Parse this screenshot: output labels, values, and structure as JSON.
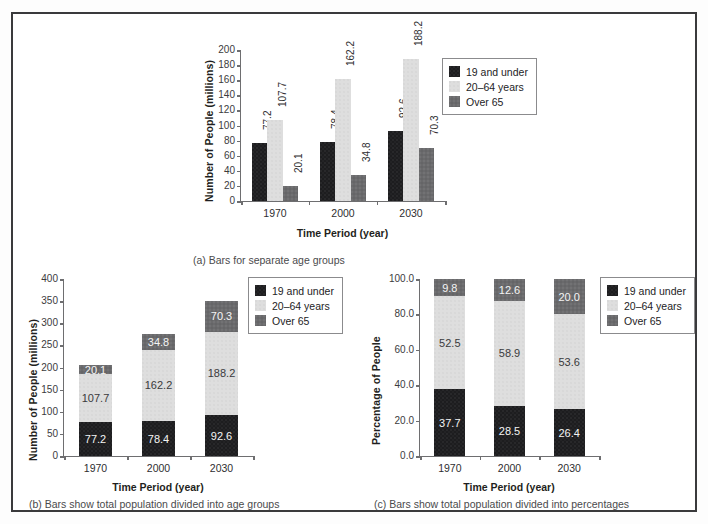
{
  "figure": {
    "legend_items": [
      {
        "label": "19 and under",
        "color": "#1d1d1f",
        "key": "under19"
      },
      {
        "label": "20–64 years",
        "color": "#dedede",
        "key": "age20_64"
      },
      {
        "label": "Over 65",
        "color": "#6a6a6c",
        "key": "over65"
      }
    ],
    "captions": {
      "a": "(a) Bars for separate age groups",
      "b": "(b) Bars show total population divided into age groups",
      "c": "(c) Bars show total population divided into percentages"
    }
  },
  "chart_data": [
    {
      "id": "a",
      "type": "bar",
      "title": "",
      "caption": "(a) Bars for separate age groups",
      "xlabel": "Time Period (year)",
      "ylabel": "Number of People (millions)",
      "categories": [
        "1970",
        "2000",
        "2030"
      ],
      "ylim": [
        0,
        200
      ],
      "yticks": [
        "0",
        "20",
        "40",
        "60",
        "80",
        "100",
        "120",
        "140",
        "160",
        "180",
        "200"
      ],
      "ytick_values": [
        0,
        20,
        40,
        60,
        80,
        100,
        120,
        140,
        160,
        180,
        200
      ],
      "grid": false,
      "legend_position": "upper-right-outside",
      "grouping": "grouped",
      "series": [
        {
          "name": "19 and under",
          "color": "#1d1d1f",
          "values": [
            77.2,
            78.4,
            92.6
          ],
          "labels": [
            "77.2",
            "78.4",
            "92.6"
          ]
        },
        {
          "name": "20–64 years",
          "color": "#dedede",
          "values": [
            107.7,
            162.2,
            188.2
          ],
          "labels": [
            "107.7",
            "162.2",
            "188.2"
          ]
        },
        {
          "name": "Over 65",
          "color": "#6a6a6c",
          "values": [
            20.1,
            34.8,
            70.3
          ],
          "labels": [
            "20.1",
            "34.8",
            "70.3"
          ]
        }
      ]
    },
    {
      "id": "b",
      "type": "bar",
      "title": "",
      "caption": "(b) Bars show total population divided into age groups",
      "xlabel": "Time Period (year)",
      "ylabel": "Number of People (millions)",
      "categories": [
        "1970",
        "2000",
        "2030"
      ],
      "ylim": [
        0,
        400
      ],
      "yticks": [
        "0",
        "50",
        "100",
        "150",
        "200",
        "250",
        "300",
        "350",
        "400"
      ],
      "ytick_values": [
        0,
        50,
        100,
        150,
        200,
        250,
        300,
        350,
        400
      ],
      "grid": false,
      "legend_position": "upper-right-inside",
      "grouping": "stacked",
      "series": [
        {
          "name": "19 and under",
          "color": "#1d1d1f",
          "values": [
            77.2,
            78.4,
            92.6
          ],
          "labels": [
            "77.2",
            "78.4",
            "92.6"
          ]
        },
        {
          "name": "20–64 years",
          "color": "#dedede",
          "values": [
            107.7,
            162.2,
            188.2
          ],
          "labels": [
            "107.7",
            "162.2",
            "188.2"
          ]
        },
        {
          "name": "Over 65",
          "color": "#6a6a6c",
          "values": [
            20.1,
            34.8,
            70.3
          ],
          "labels": [
            "20.1",
            "34.8",
            "70.3"
          ]
        }
      ],
      "totals": [
        205.0,
        275.4,
        351.1
      ]
    },
    {
      "id": "c",
      "type": "bar",
      "title": "",
      "caption": "(c) Bars show total population divided into percentages",
      "xlabel": "Time Period (year)",
      "ylabel": "Percentage of People",
      "categories": [
        "1970",
        "2000",
        "2030"
      ],
      "ylim": [
        0,
        100
      ],
      "yticks": [
        "0.0",
        "20.0",
        "40.0",
        "60.0",
        "80.0",
        "100.0"
      ],
      "ytick_values": [
        0,
        20,
        40,
        60,
        80,
        100
      ],
      "grid": false,
      "legend_position": "upper-right-inside",
      "grouping": "stacked-percent",
      "series": [
        {
          "name": "19 and under",
          "color": "#1d1d1f",
          "values": [
            37.7,
            28.5,
            26.4
          ],
          "labels": [
            "37.7",
            "28.5",
            "26.4"
          ]
        },
        {
          "name": "20–64 years",
          "color": "#dedede",
          "values": [
            52.5,
            58.9,
            53.6
          ],
          "labels": [
            "52.5",
            "58.9",
            "53.6"
          ]
        },
        {
          "name": "Over 65",
          "color": "#6a6a6c",
          "values": [
            9.8,
            12.6,
            20.0
          ],
          "labels": [
            "9.8",
            "12.6",
            "20.0"
          ]
        }
      ]
    }
  ]
}
